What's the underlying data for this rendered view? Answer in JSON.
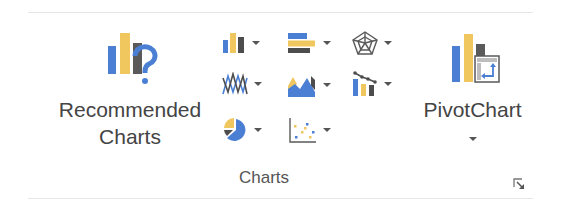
{
  "group": {
    "label": "Charts",
    "dialog_launcher_icon": "dialog-launcher-icon"
  },
  "recommended": {
    "line1": "Recommended",
    "line2": "Charts",
    "icon": "recommended-charts-icon"
  },
  "pivot": {
    "label": "PivotChart",
    "icon": "pivot-chart-icon"
  },
  "chart_types": [
    {
      "name": "column-chart",
      "icon": "column-chart-icon"
    },
    {
      "name": "bar-chart",
      "icon": "bar-chart-icon"
    },
    {
      "name": "radar-chart",
      "icon": "radar-chart-icon"
    },
    {
      "name": "line-chart",
      "icon": "line-chart-icon"
    },
    {
      "name": "area-chart",
      "icon": "area-chart-icon"
    },
    {
      "name": "combo-chart",
      "icon": "combo-chart-icon"
    },
    {
      "name": "pie-chart",
      "icon": "pie-chart-icon"
    },
    {
      "name": "scatter-chart",
      "icon": "scatter-chart-icon"
    }
  ],
  "colors": {
    "blue": "#4a7fd4",
    "gold": "#f0c75e",
    "dark": "#4d4d4d",
    "text": "#444444"
  }
}
